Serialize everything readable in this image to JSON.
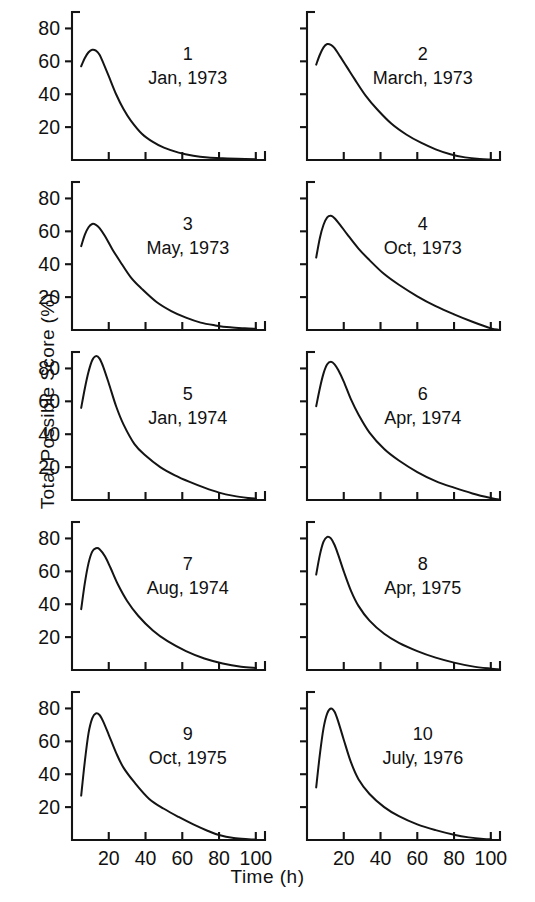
{
  "figure": {
    "ylabel": "Total  Possible  Score (%)",
    "xlabel": "Time  (h)"
  },
  "chart_data": {
    "type": "line",
    "title": "",
    "xlabel": "Time (h)",
    "ylabel": "Total Possible Score (%)",
    "xlim": [
      0,
      105
    ],
    "ylim": [
      0,
      90
    ],
    "xticks": [
      20,
      40,
      60,
      80,
      100
    ],
    "xtick_labels": [
      "20",
      "40",
      "60",
      "80",
      "100"
    ],
    "yticks": [
      20,
      40,
      60,
      80
    ],
    "ytick_labels": [
      "20",
      "40",
      "60",
      "80"
    ],
    "grid": false,
    "legend": "none",
    "y_tick_labels_shown_on": "left column only",
    "x_tick_labels_shown_on": "bottom row only",
    "panels": [
      {
        "number": "1",
        "date": "Jan, 1973",
        "x": [
          5,
          7,
          9,
          11,
          13,
          15,
          17,
          20,
          24,
          28,
          32,
          38,
          44,
          50,
          58,
          66,
          74,
          82,
          90,
          100
        ],
        "y": [
          57,
          62,
          65.5,
          67,
          66.5,
          64,
          59,
          51,
          40,
          31,
          24,
          16,
          11,
          7.5,
          4.5,
          2.6,
          1.5,
          1.0,
          0.7,
          0.5
        ]
      },
      {
        "number": "2",
        "date": "March, 1973",
        "x": [
          5,
          7,
          9,
          11,
          13,
          15,
          18,
          22,
          26,
          32,
          38,
          46,
          54,
          62,
          70,
          78,
          86,
          94,
          100
        ],
        "y": [
          58,
          64,
          68.5,
          70.5,
          70,
          68,
          63,
          56,
          49,
          39,
          31,
          22,
          15.5,
          10.5,
          6.5,
          3.5,
          1.6,
          0.6,
          0.3
        ]
      },
      {
        "number": "3",
        "date": "May, 1973",
        "x": [
          5,
          7,
          9,
          11,
          13,
          15,
          18,
          22,
          26,
          32,
          38,
          46,
          54,
          62,
          70,
          78,
          86,
          94,
          100
        ],
        "y": [
          51,
          58,
          62.5,
          64.5,
          64,
          62,
          57,
          49,
          42,
          32,
          25,
          17,
          11.5,
          7.5,
          4.5,
          2.8,
          1.6,
          1.0,
          0.7
        ]
      },
      {
        "number": "4",
        "date": "Oct, 1973",
        "x": [
          5,
          7,
          9,
          11,
          13,
          15,
          18,
          22,
          28,
          34,
          42,
          50,
          60,
          70,
          80,
          90,
          100,
          104
        ],
        "y": [
          44,
          56,
          64,
          68.5,
          69.5,
          68,
          64,
          58,
          49.5,
          42.5,
          34,
          27.5,
          20.5,
          14.5,
          9.5,
          5.0,
          1.0,
          0.2
        ]
      },
      {
        "number": "5",
        "date": "Jan, 1974",
        "x": [
          5,
          7,
          9,
          11,
          13,
          15,
          17,
          20,
          24,
          28,
          34,
          40,
          48,
          56,
          64,
          72,
          80,
          88,
          96,
          100
        ],
        "y": [
          56,
          68,
          78,
          85,
          87.5,
          86,
          81,
          71,
          57,
          46,
          34,
          27,
          20,
          15,
          11,
          7.5,
          4.5,
          2.5,
          1.2,
          0.8
        ]
      },
      {
        "number": "6",
        "date": "Apr, 1974",
        "x": [
          5,
          7,
          9,
          11,
          13,
          15,
          17,
          20,
          24,
          28,
          34,
          42,
          50,
          60,
          70,
          80,
          90,
          100,
          104
        ],
        "y": [
          57,
          68,
          77,
          82.5,
          84,
          82.5,
          79,
          72,
          61,
          52,
          41,
          31,
          24,
          17,
          11.5,
          7.5,
          4.0,
          1.2,
          0.4
        ]
      },
      {
        "number": "7",
        "date": "Aug, 1974",
        "x": [
          5,
          7,
          9,
          11,
          13,
          15,
          18,
          21,
          25,
          30,
          36,
          44,
          52,
          62,
          72,
          82,
          92,
          100
        ],
        "y": [
          37,
          53,
          65,
          72,
          74,
          73.5,
          69,
          62,
          52,
          42,
          33,
          24,
          17.5,
          11.5,
          7.0,
          4.0,
          2.0,
          1.2
        ]
      },
      {
        "number": "8",
        "date": "Apr, 1975",
        "x": [
          5,
          7,
          9,
          11,
          13,
          15,
          17,
          20,
          24,
          28,
          34,
          42,
          50,
          60,
          70,
          80,
          90,
          100,
          104
        ],
        "y": [
          58,
          70,
          78,
          81,
          80,
          76,
          70,
          60,
          48,
          39,
          30,
          22,
          16.5,
          11.5,
          7.5,
          4.5,
          2.2,
          0.8,
          0.4
        ]
      },
      {
        "number": "9",
        "date": "Oct, 1975",
        "x": [
          5,
          7,
          9,
          11,
          13,
          15,
          17,
          20,
          24,
          28,
          34,
          42,
          50,
          58,
          66,
          74,
          80,
          88,
          96,
          100
        ],
        "y": [
          27,
          48,
          65,
          74,
          77,
          76,
          72,
          64,
          53,
          44,
          35,
          25,
          19,
          14,
          9.5,
          5.5,
          3.0,
          1.2,
          0.5,
          0.3
        ]
      },
      {
        "number": "10",
        "date": "July, 1976",
        "x": [
          5,
          7,
          9,
          11,
          13,
          15,
          17,
          20,
          24,
          28,
          34,
          42,
          50,
          60,
          70,
          80,
          88,
          96,
          100
        ],
        "y": [
          32,
          52,
          68,
          77,
          80,
          78,
          72,
          61,
          47,
          37,
          28,
          20,
          14.5,
          9.5,
          6.0,
          3.2,
          1.6,
          0.6,
          0.4
        ]
      }
    ]
  }
}
